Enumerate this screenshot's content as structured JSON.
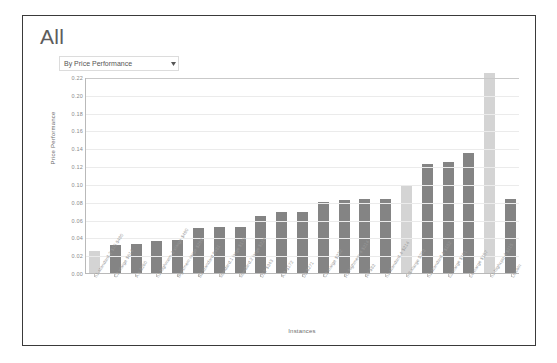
{
  "card": {
    "title": "All",
    "filter": {
      "selected": "By Price Performance",
      "caret_icon": "chevron-down-icon"
    }
  },
  "chart_data": {
    "type": "bar",
    "title": "All",
    "xlabel": "Instances",
    "ylabel": "Price Performance",
    "ylim": [
      0.0,
      0.22
    ],
    "ytick_labels": [
      "0.22",
      "0.20",
      "0.18",
      "0.16",
      "0.14",
      "0.12",
      "0.10",
      "0.08",
      "0.06",
      "0.04",
      "0.02",
      "0.00"
    ],
    "ytick_values": [
      0.22,
      0.2,
      0.18,
      0.16,
      0.14,
      0.12,
      0.1,
      0.08,
      0.06,
      0.04,
      0.02,
      0.0
    ],
    "grid": true,
    "legend": "none",
    "highlight_color": "#d4d4d4",
    "bar_color": "#848484",
    "categories": [
      "n1-standard-2 $15 $490",
      "C2 xlarge $614",
      "A.s $260",
      "n1-highmem-2 xlarge $490",
      "Big/xmem-large $299",
      "B2 standard $481",
      "standard.1 large $173",
      "standard.2 large $224",
      "D12 $343",
      "A.3 $172",
      "D3 $271",
      "C3 xlarge $232",
      "R1 highmem-4 $214",
      "R4 $82",
      "n1-standard-4 $214",
      "m3.xlarge $202",
      "n1-standard-4 $182",
      "c3.xlarge $191",
      "c4.xlarge $157",
      "n1-highcpu-4 $115",
      "Lincoln"
    ],
    "values": [
      0.025,
      0.032,
      0.033,
      0.036,
      0.037,
      0.05,
      0.052,
      0.052,
      0.064,
      0.068,
      0.069,
      0.08,
      0.082,
      0.083,
      0.083,
      0.098,
      0.122,
      0.125,
      0.135,
      0.225,
      0.083
    ],
    "highlighted_indices": [
      0,
      15,
      19
    ]
  }
}
